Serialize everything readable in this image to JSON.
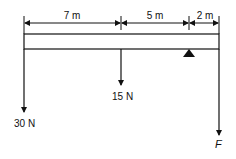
{
  "diagram": {
    "type": "beam-statics",
    "dimensions": [
      {
        "label": "7 m",
        "from_x": 24,
        "to_x": 121
      },
      {
        "label": "5 m",
        "from_x": 121,
        "to_x": 189
      },
      {
        "label": "2 m",
        "from_x": 189,
        "to_x": 219
      }
    ],
    "beam": {
      "x": 24,
      "y": 34,
      "width": 195,
      "height": 15
    },
    "support": {
      "type": "triangle",
      "x": 189,
      "y": 49
    },
    "forces": [
      {
        "label": "30 N",
        "x": 24,
        "y_end": 112,
        "label_x": 8,
        "label_y": 126
      },
      {
        "label": "15 N",
        "x": 121,
        "y_end": 85,
        "label_x": 112,
        "label_y": 100
      },
      {
        "label": "F",
        "x": 219,
        "y_end": 135,
        "label_x": 215,
        "label_y": 148
      }
    ],
    "colors": {
      "ink": "#111111",
      "background": "#ffffff"
    }
  }
}
